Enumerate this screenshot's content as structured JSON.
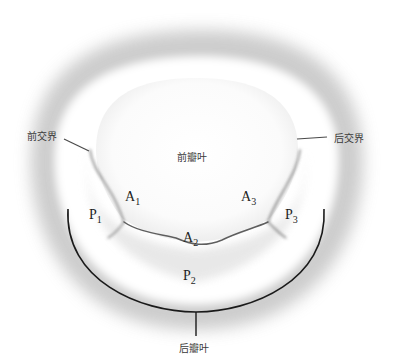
{
  "figure": {
    "labels": {
      "anterior_commissure": "前交界",
      "posterior_commissure": "后交界",
      "anterior_leaflet": "前瓣叶",
      "posterior_leaflet": "后瓣叶"
    },
    "segments": [
      {
        "letter": "A",
        "index": "1"
      },
      {
        "letter": "A",
        "index": "2"
      },
      {
        "letter": "A",
        "index": "3"
      },
      {
        "letter": "P",
        "index": "1"
      },
      {
        "letter": "P",
        "index": "2"
      },
      {
        "letter": "P",
        "index": "3"
      }
    ],
    "colors": {
      "annulus_shadow": "#bdbdbd",
      "leaflet_fill": "#f4f4f4",
      "coaptation_line": "#6a6a6a",
      "bracket": "#1a1a1a",
      "label_text": "#3a3a3a"
    }
  }
}
